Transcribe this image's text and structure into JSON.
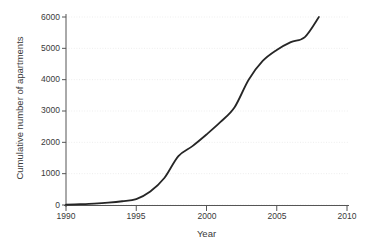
{
  "chart_data": {
    "type": "line",
    "title": "",
    "xlabel": "Year",
    "ylabel": "Cumulative number of apartments",
    "xlim": [
      1990,
      2010
    ],
    "ylim": [
      0,
      6000
    ],
    "xticks": [
      1990,
      1995,
      2000,
      2005,
      2010
    ],
    "xtick_labels": [
      "1990",
      "1995",
      "2000",
      "2005",
      "2010"
    ],
    "yticks": [
      0,
      1000,
      2000,
      3000,
      4000,
      5000,
      6000
    ],
    "ytick_labels": [
      "0",
      "1000",
      "2000",
      "3000",
      "4000",
      "5000",
      "6000"
    ],
    "grid": "horizontal-dotted",
    "legend": "none",
    "series": [
      {
        "name": "Cumulative number of apartments",
        "color": "#262626",
        "line_width": 1.8,
        "x": [
          1990,
          1991,
          1992,
          1993,
          1994,
          1995,
          1996,
          1997,
          1998,
          1999,
          2000,
          2001,
          2002,
          2003,
          2004,
          2005,
          2006,
          2007,
          2008
        ],
        "values": [
          10,
          25,
          45,
          75,
          120,
          190,
          430,
          860,
          1560,
          1880,
          2250,
          2650,
          3120,
          4000,
          4600,
          4950,
          5200,
          5360,
          6000
        ]
      }
    ]
  },
  "figure": {
    "background_color": "#ffffff",
    "axis_color": "#555555",
    "grid_color": "#ededed",
    "text_color": "#3a3a3a"
  }
}
